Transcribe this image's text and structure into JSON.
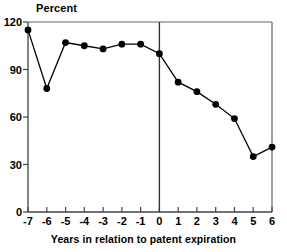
{
  "chart_data": {
    "type": "line",
    "title": "",
    "xlabel": "Years in relation to patent expiration",
    "ylabel": "Percent",
    "x": [
      -7,
      -6,
      -5,
      -4,
      -3,
      -2,
      -1,
      0,
      1,
      2,
      3,
      4,
      5,
      6
    ],
    "values": [
      115,
      78,
      107,
      105,
      103,
      106,
      106,
      100,
      82,
      76,
      68,
      59,
      35,
      41
    ],
    "series": [
      {
        "name": "Percent",
        "values": [
          115,
          78,
          107,
          105,
          103,
          106,
          106,
          100,
          82,
          76,
          68,
          59,
          35,
          41
        ]
      }
    ],
    "xtick_labels": [
      "-7",
      "-6",
      "-5",
      "-4",
      "-3",
      "-2",
      "-1",
      "0",
      "1",
      "2",
      "3",
      "4",
      "5",
      "6"
    ],
    "ytick_labels": [
      "0",
      "30",
      "60",
      "90",
      "120"
    ],
    "yticks": [
      0,
      30,
      60,
      90,
      120
    ],
    "xlim": [
      -7,
      6
    ],
    "ylim": [
      0,
      120
    ],
    "grid": false,
    "legend": false,
    "legend_position": "none",
    "marker": "filled-circle",
    "line_color": "#000000",
    "marker_color": "#000000",
    "axis_color": "#555555",
    "annotations": [
      {
        "name": "patent-expiration-reference-line",
        "type": "vline",
        "x": 0,
        "label": ""
      }
    ]
  }
}
